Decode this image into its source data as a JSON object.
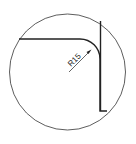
{
  "diagram": {
    "type": "detail-view",
    "dimension": {
      "label": "R15"
    },
    "colors": {
      "stroke": "#222222",
      "background": "#ffffff"
    }
  }
}
